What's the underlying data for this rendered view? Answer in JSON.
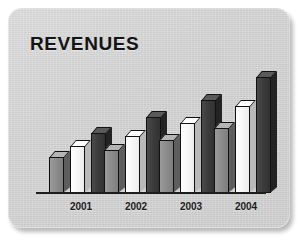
{
  "chart": {
    "title": "REVENUES",
    "panel_background": "#d6d6d6",
    "axis_color": "#1d1d1d"
  },
  "chart_data": {
    "type": "bar",
    "title": "REVENUES",
    "xlabel": "",
    "ylabel": "",
    "grid": false,
    "legend_position": "none",
    "axis_ranges": {
      "ylim": [
        0,
        120
      ]
    },
    "categories": [
      "2001",
      "2002",
      "2003",
      "2004"
    ],
    "series": [
      {
        "name": "series-gray",
        "color": "#8a8a8a",
        "values": [
          36,
          43,
          53,
          65
        ]
      },
      {
        "name": "series-white",
        "color": "#f5f5f5",
        "values": [
          47,
          57,
          70,
          87
        ]
      },
      {
        "name": "series-dark",
        "color": "#3a3a3a",
        "values": [
          60,
          76,
          93,
          116
        ]
      }
    ]
  },
  "bars": [
    {
      "name": "bar-2001-gray",
      "series": "gray",
      "label": "2001",
      "left": 41,
      "width": 15,
      "height": 36
    },
    {
      "name": "bar-2001-white",
      "series": "white",
      "label": "2001",
      "left": 62,
      "width": 15,
      "height": 47
    },
    {
      "name": "bar-2001-dark",
      "series": "dark",
      "label": "2001",
      "left": 83,
      "width": 15,
      "height": 60
    },
    {
      "name": "bar-2002-gray",
      "series": "gray",
      "label": "2002",
      "left": 96,
      "width": 15,
      "height": 43
    },
    {
      "name": "bar-2002-white",
      "series": "white",
      "label": "2002",
      "left": 117,
      "width": 15,
      "height": 57
    },
    {
      "name": "bar-2002-dark",
      "series": "dark",
      "label": "2002",
      "left": 138,
      "width": 15,
      "height": 76
    },
    {
      "name": "bar-2003-gray",
      "series": "gray",
      "label": "2003",
      "left": 151,
      "width": 15,
      "height": 53
    },
    {
      "name": "bar-2003-white",
      "series": "white",
      "label": "2003",
      "left": 172,
      "width": 15,
      "height": 70
    },
    {
      "name": "bar-2003-dark",
      "series": "dark",
      "label": "2003",
      "left": 193,
      "width": 15,
      "height": 93
    },
    {
      "name": "bar-2004-gray",
      "series": "gray",
      "label": "2004",
      "left": 206,
      "width": 15,
      "height": 65
    },
    {
      "name": "bar-2004-white",
      "series": "white",
      "label": "2004",
      "left": 227,
      "width": 15,
      "height": 87
    },
    {
      "name": "bar-2004-dark",
      "series": "dark",
      "label": "2004",
      "left": 248,
      "width": 15,
      "height": 116
    }
  ],
  "category_labels": [
    {
      "text": "2001",
      "left": 50
    },
    {
      "text": "2002",
      "left": 105
    },
    {
      "text": "2003",
      "left": 160
    },
    {
      "text": "2004",
      "left": 215
    }
  ]
}
